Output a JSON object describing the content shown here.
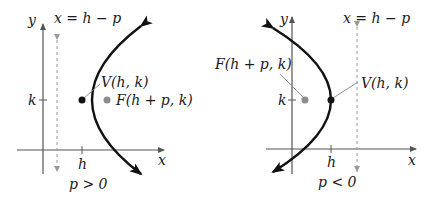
{
  "colors": {
    "axis": "#555555",
    "curve": "#111111",
    "directrix": "#999999",
    "focus": "#8c8c8c",
    "vertex": "#111111",
    "leader": "#888888",
    "text": "#1a1a1a"
  },
  "left_panel": {
    "y_axis_label": "y",
    "x_axis_label": "x",
    "directrix_label": "x = h − p",
    "k_tick_label": "k",
    "h_tick_label": "h",
    "vertex_label": "V(h, k)",
    "focus_label": "F(h + p, k)",
    "condition_label": "p > 0"
  },
  "right_panel": {
    "y_axis_label": "y",
    "x_axis_label": "x",
    "directrix_label": "x = h − p",
    "k_tick_label": "k",
    "h_tick_label": "h",
    "vertex_label": "V(h, k)",
    "focus_label": "F(h + p, k)",
    "condition_label": "p < 0"
  }
}
